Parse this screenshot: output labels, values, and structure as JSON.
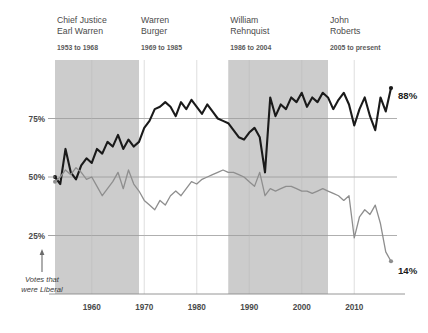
{
  "chart_data": {
    "type": "line",
    "title": "",
    "xlabel": "",
    "ylabel": "",
    "xlim": [
      1953,
      2017
    ],
    "ylim": [
      0,
      100
    ],
    "grid": true,
    "legend_position": "inline-end-labels",
    "ytick_labels": [
      "75%",
      "50%",
      "25%"
    ],
    "ytick_values": [
      75,
      50,
      25
    ],
    "xtick_labels": [
      "1960",
      "1970",
      "1980",
      "1990",
      "2000",
      "2010"
    ],
    "xtick_values": [
      1960,
      1970,
      1980,
      1990,
      2000,
      2010
    ],
    "annotation": "Votes that were Liberal",
    "series": [
      {
        "name": "unanimous-or-majority-black",
        "color": "#1a1a1a",
        "width": 2.1,
        "end_label": "88%",
        "end_value": 88,
        "x": [
          1953,
          1954,
          1955,
          1956,
          1957,
          1958,
          1959,
          1960,
          1961,
          1962,
          1963,
          1964,
          1965,
          1966,
          1967,
          1968,
          1969,
          1970,
          1971,
          1972,
          1973,
          1974,
          1975,
          1976,
          1977,
          1978,
          1979,
          1980,
          1981,
          1982,
          1983,
          1984,
          1985,
          1986,
          1987,
          1988,
          1989,
          1990,
          1991,
          1992,
          1993,
          1994,
          1995,
          1996,
          1997,
          1998,
          1999,
          2000,
          2001,
          2002,
          2003,
          2004,
          2005,
          2006,
          2007,
          2008,
          2009,
          2010,
          2011,
          2012,
          2013,
          2014,
          2015,
          2016,
          2017
        ],
        "values": [
          50,
          47,
          62,
          52,
          49,
          55,
          58,
          56,
          62,
          60,
          65,
          63,
          68,
          62,
          66,
          63,
          65,
          71,
          74,
          79,
          80,
          82,
          80,
          76,
          82,
          79,
          83,
          80,
          77,
          81,
          78,
          75,
          74,
          73,
          70,
          67,
          66,
          69,
          71,
          67,
          52,
          84,
          76,
          81,
          79,
          84,
          82,
          86,
          80,
          84,
          82,
          86,
          84,
          79,
          83,
          86,
          81,
          72,
          79,
          84,
          76,
          70,
          84,
          78,
          88
        ]
      },
      {
        "name": "dissent-rate-gray",
        "color": "#8e8e8e",
        "width": 1.3,
        "end_label": "14%",
        "end_value": 14,
        "x": [
          1953,
          1954,
          1955,
          1956,
          1957,
          1958,
          1959,
          1960,
          1961,
          1962,
          1963,
          1964,
          1965,
          1966,
          1967,
          1968,
          1969,
          1970,
          1971,
          1972,
          1973,
          1974,
          1975,
          1976,
          1977,
          1978,
          1979,
          1980,
          1981,
          1982,
          1983,
          1984,
          1985,
          1986,
          1987,
          1988,
          1989,
          1990,
          1991,
          1992,
          1993,
          1994,
          1995,
          1996,
          1997,
          1998,
          1999,
          2000,
          2001,
          2002,
          2003,
          2004,
          2005,
          2006,
          2007,
          2008,
          2009,
          2010,
          2011,
          2012,
          2013,
          2014,
          2015,
          2016,
          2017
        ],
        "values": [
          48,
          50,
          53,
          51,
          54,
          52,
          49,
          50,
          46,
          42,
          45,
          48,
          52,
          45,
          53,
          47,
          44,
          40,
          38,
          36,
          40,
          38,
          42,
          44,
          42,
          45,
          48,
          47,
          49,
          50,
          51,
          52,
          53,
          52,
          52,
          51,
          50,
          48,
          46,
          52,
          42,
          45,
          44,
          45,
          46,
          46,
          45,
          44,
          44,
          43,
          44,
          45,
          44,
          43,
          42,
          40,
          42,
          24,
          33,
          36,
          34,
          38,
          30,
          18,
          14
        ]
      }
    ],
    "eras": [
      {
        "title_line1": "Chief Justice",
        "title_line2": "Earl Warren",
        "years": "1953 to 1968",
        "start": 1953,
        "end": 1968,
        "shaded": true
      },
      {
        "title_line1": "Warren",
        "title_line2": "Burger",
        "years": "1969 to 1985",
        "start": 1969,
        "end": 1985,
        "shaded": false
      },
      {
        "title_line1": "William",
        "title_line2": "Rehnquist",
        "years": "1986 to 2004",
        "start": 1986,
        "end": 2004,
        "shaded": true
      },
      {
        "title_line1": "John",
        "title_line2": "Roberts",
        "years": "2005 to present",
        "start": 2005,
        "end": 2017,
        "shaded": false
      }
    ],
    "colors": {
      "band": "#cccccc",
      "grid": "#9a9a9a",
      "axis": "#8a8a8a",
      "background": "#ffffff"
    }
  }
}
